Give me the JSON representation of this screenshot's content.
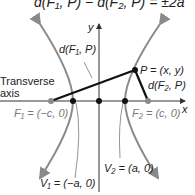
{
  "equation": "d(F₁, P) − d(F₂, P) = ±2a",
  "labels": {
    "y_axis": "y",
    "x_axis": "x",
    "d_f1_p": "d(F₁, P)",
    "d_f2_p_line1": "d(F₂, P)",
    "point_p": "P = (x, y)",
    "transverse_line1": "Transverse",
    "transverse_line2": "axis",
    "f1": "F₁ = (−c, 0)",
    "f2": "F₂ = (c, 0)",
    "v1": "V₁ = (−a, 0)",
    "v2": "V₂ = (a, 0)"
  },
  "colors": {
    "hyperbola": "#8a8a8a",
    "axes": "#333333",
    "segments": "#111111",
    "focus_points": "#8a8a8a",
    "vertex_points": "#111111"
  }
}
